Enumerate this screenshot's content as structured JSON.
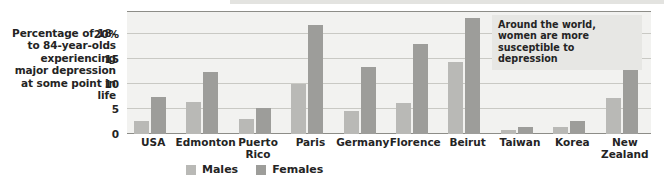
{
  "chart_data": {
    "type": "bar",
    "title": "",
    "ylabel": "Percentage of 18- to 84-year-olds experiencing major depression at some point in life",
    "xlabel": "",
    "ylim": [
      0,
      24.6
    ],
    "yticks": [
      0,
      5,
      10,
      15,
      20
    ],
    "ytick_labels": [
      "0",
      "5",
      "10",
      "15",
      "20%"
    ],
    "grid": true,
    "legend_position": "bottom",
    "categories": [
      "USA",
      "Edmonton",
      "Puerto Rico",
      "Paris",
      "Germany",
      "Florence",
      "Beirut",
      "Taiwan",
      "Korea",
      "New Zealand"
    ],
    "series": [
      {
        "name": "Males",
        "color": "#b9b9b6",
        "values": [
          2.6,
          6.5,
          3.0,
          10.0,
          4.6,
          6.2,
          14.5,
          0.8,
          1.5,
          7.3
        ]
      },
      {
        "name": "Females",
        "color": "#9d9d9a",
        "values": [
          7.4,
          12.4,
          5.3,
          21.8,
          13.5,
          18.0,
          23.2,
          1.5,
          2.6,
          15.3
        ]
      }
    ],
    "annotations": [
      {
        "text": "Around the world, women are more susceptible to depression"
      }
    ]
  },
  "axis_caption": "Percentage of 18- to 84-year-olds experiencing major depression at some point in life",
  "legend": {
    "males_label": "Males",
    "females_label": "Females"
  },
  "annotation": {
    "text": "Around the world, women are more susceptible to depression"
  }
}
